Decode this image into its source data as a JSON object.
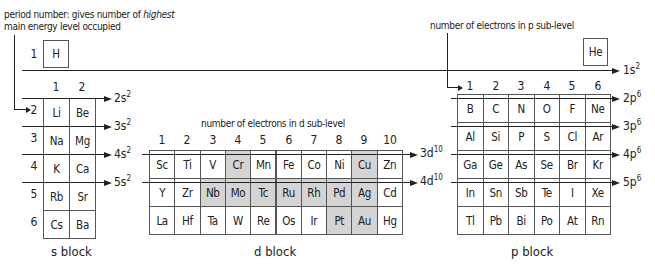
{
  "annotations": {
    "period_line1_a": "period number: gives number of ",
    "period_line1_b": "highest",
    "period_line2": "main energy level occupied",
    "d_electrons": "number of electrons in d sub-level",
    "p_electrons": "number of electrons in p sub-level"
  },
  "period1": {
    "number": "1",
    "H": "H",
    "He": "He",
    "label_main": "1s",
    "label_sup": "2"
  },
  "s_block": {
    "title": "s block",
    "columns": [
      "1",
      "2"
    ],
    "periods": [
      "2",
      "3",
      "4",
      "5",
      "6"
    ],
    "rows": [
      [
        "Li",
        "Be"
      ],
      [
        "Na",
        "Mg"
      ],
      [
        "K",
        "Ca"
      ],
      [
        "Rb",
        "Sr"
      ],
      [
        "Cs",
        "Ba"
      ]
    ],
    "arrows": [
      {
        "main": "2s",
        "sup": "2"
      },
      {
        "main": "3s",
        "sup": "2"
      },
      {
        "main": "4s",
        "sup": "2"
      },
      {
        "main": "5s",
        "sup": "2"
      }
    ]
  },
  "d_block": {
    "title": "d block",
    "columns": [
      "1",
      "2",
      "3",
      "4",
      "5",
      "6",
      "7",
      "8",
      "9",
      "10"
    ],
    "rows": [
      [
        "Sc",
        "Ti",
        "V",
        "Cr",
        "Mn",
        "Fe",
        "Co",
        "Ni",
        "Cu",
        "Zn"
      ],
      [
        "Y",
        "Zr",
        "Nb",
        "Mo",
        "Tc",
        "Ru",
        "Rh",
        "Pd",
        "Ag",
        "Cd"
      ],
      [
        "La",
        "Hf",
        "Ta",
        "W",
        "Re",
        "Os",
        "Ir",
        "Pt",
        "Au",
        "Hg"
      ]
    ],
    "highlighted": [
      [
        3,
        8
      ],
      [
        2,
        3,
        4,
        5,
        6,
        7,
        8
      ],
      [
        7,
        8
      ]
    ],
    "highlight_color": "#d4d4d4",
    "arrows": [
      {
        "main": "3d",
        "sup": "10"
      },
      {
        "main": "4d",
        "sup": "10"
      }
    ]
  },
  "p_block": {
    "title": "p block",
    "columns": [
      "1",
      "2",
      "3",
      "4",
      "5",
      "6"
    ],
    "rows": [
      [
        "B",
        "C",
        "N",
        "O",
        "F",
        "Ne"
      ],
      [
        "Al",
        "Si",
        "P",
        "S",
        "Cl",
        "Ar"
      ],
      [
        "Ga",
        "Ge",
        "As",
        "Se",
        "Br",
        "Kr"
      ],
      [
        "In",
        "Sn",
        "Sb",
        "Te",
        "I",
        "Xe"
      ],
      [
        "Tl",
        "Pb",
        "Bi",
        "Po",
        "At",
        "Rn"
      ]
    ],
    "arrows": [
      {
        "main": "2p",
        "sup": "6"
      },
      {
        "main": "3p",
        "sup": "6"
      },
      {
        "main": "4p",
        "sup": "6"
      },
      {
        "main": "5p",
        "sup": "6"
      }
    ]
  }
}
